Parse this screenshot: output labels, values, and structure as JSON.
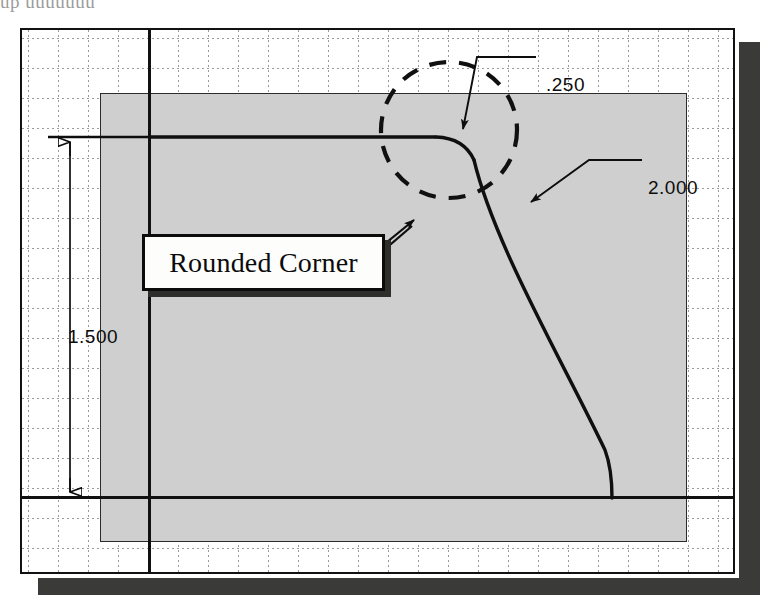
{
  "document": {
    "type": "cad-engineering-drawing",
    "scan_header_text": "up uuuuuuu",
    "ghost_bleed_text": "A   IRSTR   DRIOT   HISSA\nI I     I II II I   I I I I II\nJ I I  I I I I  I  I   I  I I I\nI I I  I I I I  I  I   I  I\nI  I I  II I"
  },
  "canvas": {
    "background_color": "#ffffff",
    "border_color": "#111111",
    "shadow_color": "#3a3a38",
    "grid": {
      "visible": true,
      "spacing_px": 30,
      "style": "dotted",
      "color": "#9a9a9a"
    }
  },
  "part": {
    "name": "sheet-metal-profile",
    "fill_color": "#cfcfcf",
    "outline_color": "#111111",
    "edge_color": "#2b2b2b"
  },
  "annotations": {
    "callout": {
      "label": "Rounded Corner",
      "box_fill": "#fdfdfb",
      "box_border": "#0c0c0c",
      "shadow": "#2e2e2c"
    },
    "dimensions": [
      {
        "id": "height",
        "value": "1.500",
        "orientation": "vertical"
      },
      {
        "id": "fillet-radius",
        "value": ".250",
        "orientation": "leader"
      },
      {
        "id": "arc-radius",
        "value": "2.000",
        "orientation": "leader"
      }
    ],
    "detail_circle": {
      "name": "detail-highlight-circle",
      "style": "dashed",
      "color": "#101010"
    }
  },
  "icons": {
    "arrow_head": "filled-triangle-arrow",
    "leader_line": "leader-line"
  }
}
